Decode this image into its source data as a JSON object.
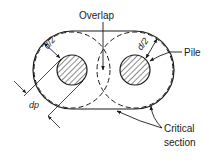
{
  "diagram": {
    "labels": {
      "overlap": "Overlap",
      "pile": "Pile",
      "half_d_left": "d/2",
      "half_d_right": "d/2",
      "pile_diameter": "dp",
      "critical_section_line1": "Critical",
      "critical_section_line2": "section"
    },
    "colors": {
      "stroke": "#1a1a1a",
      "background": "#ffffff"
    }
  }
}
